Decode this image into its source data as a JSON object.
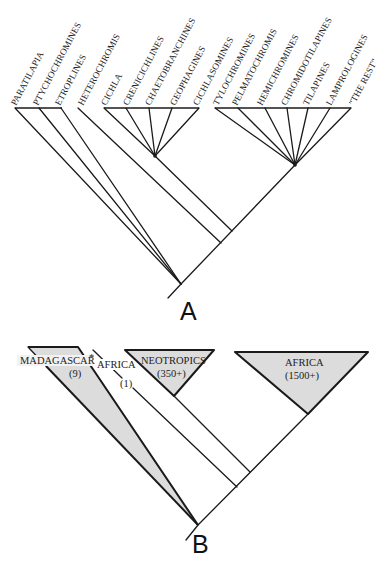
{
  "figure": {
    "panels": [
      {
        "id": "A",
        "label": "A",
        "title": "Cichlid phylogeny (lineages)",
        "tips": [
          {
            "name": "PARATILAPIA"
          },
          {
            "name": "PTYCHOCHROMINES"
          },
          {
            "name": "ETROPLINES"
          },
          {
            "name": "HETEROCHROMIS"
          },
          {
            "name": "CICHLA"
          },
          {
            "name": "CRENICICHLINES"
          },
          {
            "name": "CHAETOBRANCHINES"
          },
          {
            "name": "GEOPHAGINES"
          },
          {
            "name": "CICHLASOMINES"
          },
          {
            "name": "TYLOCHROMINES"
          },
          {
            "name": "PELMATOCHROMIS"
          },
          {
            "name": "HEMICHROMINES"
          },
          {
            "name": "CHROMIDOTILAPINES"
          },
          {
            "name": "TILAPINES"
          },
          {
            "name": "LAMPROLOGINES"
          },
          {
            "name": "\"THE REST\""
          }
        ],
        "clades": [
          {
            "name": "madagascar-india-basal",
            "members": [
              "PARATILAPIA",
              "PTYCHOCHROMINES",
              "ETROPLINES"
            ]
          },
          {
            "name": "neotropical",
            "members": [
              "CICHLA",
              "CRENICICHLINES",
              "CHAETOBRANCHINES",
              "GEOPHAGINES",
              "CICHLASOMINES"
            ]
          },
          {
            "name": "african",
            "members": [
              "TYLOCHROMINES",
              "PELMATOCHROMIS",
              "HEMICHROMINES",
              "CHROMIDOTILAPINES",
              "TILAPINES",
              "LAMPROLOGINES",
              "\"THE REST\""
            ]
          }
        ]
      },
      {
        "id": "B",
        "label": "B",
        "title": "Biogeographic summary",
        "groups": [
          {
            "region": "MADAGASCAR",
            "marker": "*",
            "count": "(9)"
          },
          {
            "region": "AFRICA",
            "count": "(1)"
          },
          {
            "region": "NEOTROPICS",
            "count": "(350+)"
          },
          {
            "region": "AFRICA",
            "count": "(1500+)"
          }
        ]
      }
    ]
  }
}
